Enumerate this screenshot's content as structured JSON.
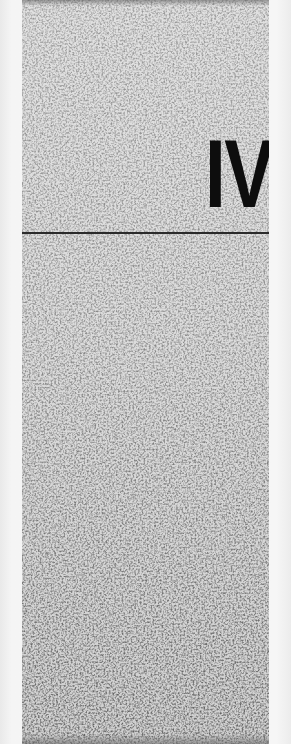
{
  "page": {
    "type": "part-divider",
    "numeral": "IV",
    "colors": {
      "numeral": "#0d0d0d",
      "rule": "#2a2a2a",
      "texture_light": "#d6d6d6",
      "texture_dark": "#4a4a4a",
      "margin": "#f2f2f2"
    }
  }
}
